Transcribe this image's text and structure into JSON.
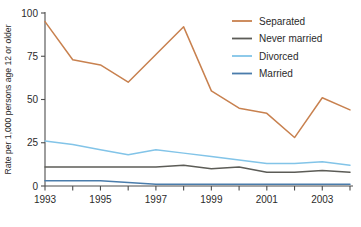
{
  "chart_data": {
    "type": "line",
    "title": "",
    "xlabel": "",
    "ylabel": "Rate per 1,000 persons age 12 or older",
    "xlim": [
      1993,
      2004
    ],
    "ylim": [
      0,
      100
    ],
    "grid": false,
    "legend_position": "top-right",
    "x": [
      1993,
      1994,
      1995,
      1996,
      1997,
      1998,
      1999,
      2000,
      2001,
      2002,
      2003,
      2004
    ],
    "xticks": [
      1993,
      1995,
      1997,
      1999,
      2001,
      2003
    ],
    "xtick_labels": [
      "1993",
      "1995",
      "1997",
      "1999",
      "2001",
      "2003"
    ],
    "xminor_ticks": [
      1994,
      1996,
      1998,
      2000,
      2002,
      2004
    ],
    "yticks": [
      0,
      25,
      50,
      75,
      100
    ],
    "ytick_labels": [
      "0",
      "25",
      "50",
      "75",
      "100"
    ],
    "series": [
      {
        "name": "Separated",
        "color": "#c8814f",
        "values": [
          95,
          73,
          70,
          60,
          76,
          92,
          55,
          45,
          42,
          28,
          51,
          44
        ]
      },
      {
        "name": "Never married",
        "color": "#5c5c57",
        "values": [
          11,
          11,
          11,
          11,
          11,
          12,
          10,
          11,
          8,
          8,
          9,
          8
        ]
      },
      {
        "name": "Divorced",
        "color": "#82c4e8",
        "values": [
          26,
          24,
          21,
          18,
          21,
          19,
          17,
          15,
          13,
          13,
          14,
          12
        ]
      },
      {
        "name": "Married",
        "color": "#4a7cab",
        "values": [
          3,
          3,
          3,
          2,
          1,
          1,
          1,
          1,
          1,
          1,
          1,
          1
        ]
      }
    ]
  },
  "legend": {
    "entries": [
      {
        "label": "Separated"
      },
      {
        "label": "Never married"
      },
      {
        "label": "Divorced"
      },
      {
        "label": "Married"
      }
    ]
  }
}
